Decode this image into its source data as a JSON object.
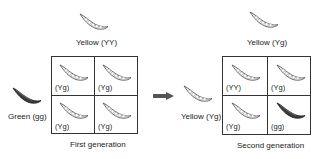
{
  "parents_first": {
    "top": {
      "label": "Yellow (YY)",
      "color": "yellow"
    },
    "left": {
      "label": "Green (gg)",
      "color": "green"
    }
  },
  "first_generation": {
    "caption": "First generation",
    "cells": [
      {
        "label": "(Yg)",
        "color": "yellow"
      },
      {
        "label": "(Yg)",
        "color": "yellow"
      },
      {
        "label": "(Yg)",
        "color": "yellow"
      },
      {
        "label": "(Yg)",
        "color": "yellow"
      }
    ]
  },
  "parents_second": {
    "top": {
      "label": "Yellow (Yg)",
      "color": "yellow"
    },
    "left": {
      "label": "Yellow (Yg)",
      "color": "yellow"
    }
  },
  "second_generation": {
    "caption": "Second generation",
    "cells": [
      {
        "label": "(YY)",
        "color": "yellow"
      },
      {
        "label": "(Yg)",
        "color": "yellow"
      },
      {
        "label": "(Yg)",
        "color": "yellow"
      },
      {
        "label": "(gg)",
        "color": "green"
      }
    ]
  },
  "colors": {
    "pod_yellow_fill": "#ffffff",
    "pod_outline": "#555555",
    "pod_green": "#3a3a3a",
    "arrow": "#555555",
    "grid_line": "#333333"
  }
}
